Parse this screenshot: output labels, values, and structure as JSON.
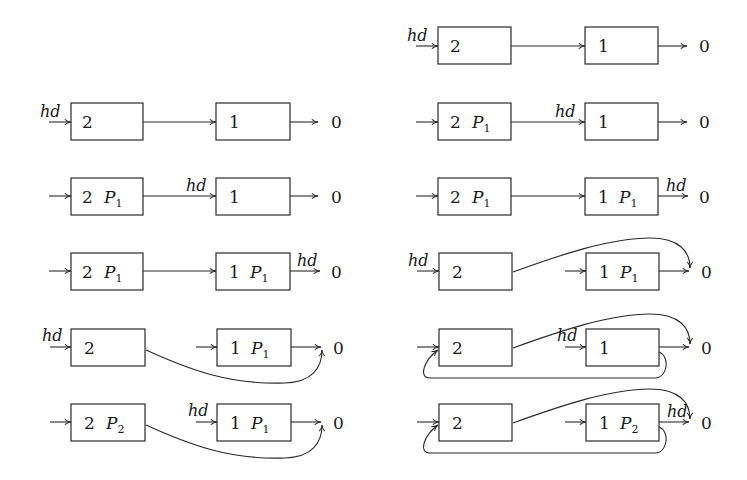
{
  "diagram": {
    "head_label": "hd",
    "null_label": "0",
    "left_column": [
      {
        "row": 1,
        "node_a": {
          "value": "2",
          "pointer": ""
        },
        "node_b": {
          "value": "1",
          "pointer": ""
        },
        "hd_position": "node_a",
        "a_links_to": "node_b"
      },
      {
        "row": 2,
        "node_a": {
          "value": "2",
          "pointer": "P",
          "sub": "1"
        },
        "node_b": {
          "value": "1",
          "pointer": ""
        },
        "hd_position": "node_b",
        "a_links_to": "node_b"
      },
      {
        "row": 3,
        "node_a": {
          "value": "2",
          "pointer": "P",
          "sub": "1"
        },
        "node_b": {
          "value": "1",
          "pointer": "P",
          "sub": "1"
        },
        "hd_position": "null",
        "a_links_to": "node_b"
      },
      {
        "row": 4,
        "node_a": {
          "value": "2",
          "pointer": ""
        },
        "node_b": {
          "value": "1",
          "pointer": "P",
          "sub": "1"
        },
        "hd_position": "node_a",
        "a_links_to": "null"
      },
      {
        "row": 5,
        "node_a": {
          "value": "2",
          "pointer": "P",
          "sub": "2"
        },
        "node_b": {
          "value": "1",
          "pointer": "P",
          "sub": "1"
        },
        "hd_position": "node_b",
        "a_links_to": "null"
      }
    ],
    "right_column": [
      {
        "row": 1,
        "node_a": {
          "value": "2",
          "pointer": ""
        },
        "node_b": {
          "value": "1",
          "pointer": ""
        },
        "hd_position": "node_a",
        "a_links_to": "node_b"
      },
      {
        "row": 2,
        "node_a": {
          "value": "2",
          "pointer": "P",
          "sub": "1"
        },
        "node_b": {
          "value": "1",
          "pointer": ""
        },
        "hd_position": "node_b",
        "a_links_to": "node_b"
      },
      {
        "row": 3,
        "node_a": {
          "value": "2",
          "pointer": "P",
          "sub": "1"
        },
        "node_b": {
          "value": "1",
          "pointer": "P",
          "sub": "1"
        },
        "hd_position": "null",
        "a_links_to": "node_b"
      },
      {
        "row": 4,
        "node_a": {
          "value": "2",
          "pointer": ""
        },
        "node_b": {
          "value": "1",
          "pointer": "P",
          "sub": "1"
        },
        "hd_position": "node_a",
        "a_links_to": "null"
      },
      {
        "row": 5,
        "node_a": {
          "value": "2",
          "pointer": ""
        },
        "node_b": {
          "value": "1",
          "pointer": ""
        },
        "hd_position": "node_b",
        "a_links_to": "null",
        "b_links_to": "node_a"
      },
      {
        "row": 6,
        "node_a": {
          "value": "2",
          "pointer": ""
        },
        "node_b": {
          "value": "1",
          "pointer": "P",
          "sub": "2"
        },
        "hd_position": "null",
        "a_links_to": "null",
        "b_links_to": "node_a"
      }
    ]
  }
}
